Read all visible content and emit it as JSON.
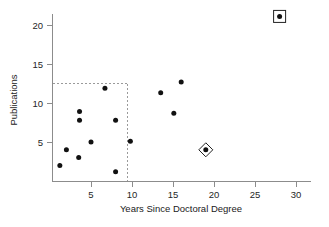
{
  "chart_data": {
    "type": "scatter",
    "title": "",
    "xlabel": "Years Since Doctoral Degree",
    "ylabel": "Publications",
    "xlim": [
      0,
      31.5
    ],
    "ylim": [
      0,
      22.5
    ],
    "xticks": [
      5,
      10,
      15,
      20,
      25,
      30
    ],
    "yticks": [
      5,
      10,
      15,
      20
    ],
    "xtick_labels": [
      "5",
      "10",
      "15",
      "20",
      "25",
      "30"
    ],
    "ytick_labels": [
      "5",
      "10",
      "15",
      "20"
    ],
    "grid": false,
    "legend": "none",
    "marker": "filled-circle",
    "marker_color": "#111111",
    "points": [
      {
        "x": 1.2,
        "y": 2.0,
        "highlight": "none"
      },
      {
        "x": 2.0,
        "y": 4.0,
        "highlight": "none"
      },
      {
        "x": 3.5,
        "y": 3.0,
        "highlight": "none"
      },
      {
        "x": 3.6,
        "y": 8.9,
        "highlight": "none"
      },
      {
        "x": 3.6,
        "y": 7.8,
        "highlight": "none"
      },
      {
        "x": 5.0,
        "y": 5.0,
        "highlight": "none"
      },
      {
        "x": 6.7,
        "y": 11.9,
        "highlight": "none"
      },
      {
        "x": 8.0,
        "y": 7.8,
        "highlight": "none"
      },
      {
        "x": 8.0,
        "y": 1.2,
        "highlight": "none"
      },
      {
        "x": 9.8,
        "y": 5.1,
        "highlight": "none"
      },
      {
        "x": 13.5,
        "y": 11.3,
        "highlight": "none"
      },
      {
        "x": 15.1,
        "y": 8.7,
        "highlight": "none"
      },
      {
        "x": 16.0,
        "y": 12.7,
        "highlight": "none"
      },
      {
        "x": 19.0,
        "y": 4.0,
        "highlight": "diamond"
      },
      {
        "x": 28.0,
        "y": 21.1,
        "highlight": "square"
      }
    ],
    "annotations": [
      {
        "kind": "dashed-reference-box",
        "description": "dashed lines marking upper-left cluster bounds",
        "y_value": 12.5,
        "x_value": 9.4,
        "color": "#9a9a9a"
      }
    ]
  },
  "axes": {
    "x_title": "Years Since Doctoral Degree",
    "y_title": "Publications"
  }
}
